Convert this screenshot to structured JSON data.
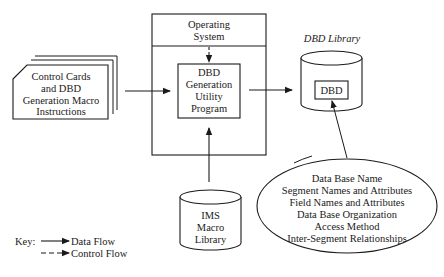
{
  "diagram": {
    "input_cards": {
      "lines": [
        "Control Cards",
        "and DBD",
        "Generation Macro",
        "Instructions"
      ]
    },
    "operating_system": {
      "lines": [
        "Operating",
        "System"
      ]
    },
    "utility_program": {
      "lines": [
        "DBD",
        "Generation",
        "Utility",
        "Program"
      ]
    },
    "dbd_library": {
      "label": "DBD Library",
      "inner_box": "DBD"
    },
    "ims_macro_library": {
      "lines": [
        "IMS",
        "Macro",
        "Library"
      ]
    },
    "dbd_contents": {
      "lines": [
        "Data Base Name",
        "Segment Names and Attributes",
        "Field Names and Attributes",
        "Data Base Organization",
        "Access Method",
        "Inter-Segment Relationships"
      ]
    },
    "key": {
      "label": "Key:",
      "items": [
        {
          "style": "solid",
          "label": "Data Flow"
        },
        {
          "style": "dashed",
          "label": "Control Flow"
        }
      ]
    },
    "colors": {
      "stroke": "#1a1a1a",
      "background": "#ffffff"
    }
  }
}
